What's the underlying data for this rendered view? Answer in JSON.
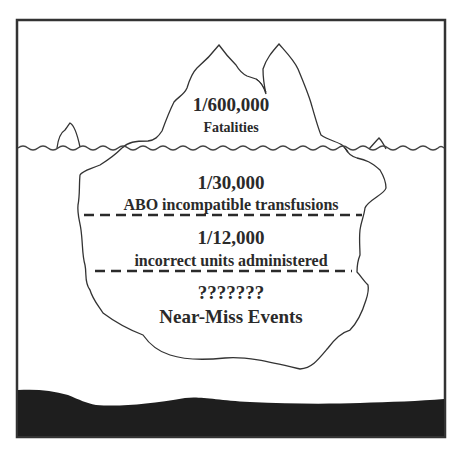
{
  "diagram": {
    "type": "iceberg",
    "colors": {
      "background": "#ffffff",
      "outline": "#333333",
      "text": "#2a2a2a",
      "seabed": "#1e1e1e"
    },
    "tiers": [
      {
        "position": "above-water",
        "rate": "1/600,000",
        "label": "Fatalities"
      },
      {
        "position": "below-water",
        "rate": "1/30,000",
        "label": "ABO incompatible transfusions"
      },
      {
        "position": "below-water",
        "rate": "1/12,000",
        "label": "incorrect units administered"
      },
      {
        "position": "below-water",
        "rate": "???????",
        "label": "Near-Miss Events"
      }
    ],
    "elements": [
      "frame",
      "iceberg-tip",
      "water-line",
      "small-iceberg-left",
      "small-iceberg-right",
      "iceberg-body",
      "divider-1",
      "divider-2",
      "seabed"
    ]
  }
}
